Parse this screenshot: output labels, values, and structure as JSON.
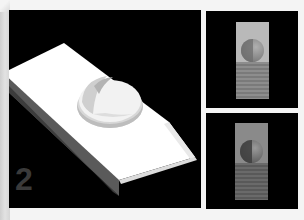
{
  "figure": {
    "step_number": "2",
    "main_view": {
      "description": "3D render of white wedge-shaped block with a dome on top",
      "background": "#000000",
      "object_color": "#ffffff",
      "number_color": "#3a3a3a"
    },
    "thumbnails": [
      {
        "position": "top-right",
        "description": "vertical rectangle with light sphere over striped base",
        "colors": {
          "top": "#b9b9b9",
          "ball": "#8a8a8a",
          "ball_shadow": "#6e6e6e",
          "stripe_a": "#8d8d8d",
          "stripe_b": "#7a7a7a"
        }
      },
      {
        "position": "bottom-right",
        "description": "vertical rectangle with darker sphere over striped base",
        "colors": {
          "top": "#8a8a8a",
          "ball": "#6f6f6f",
          "ball_shadow": "#3e3e3e",
          "stripe_a": "#6a6a6a",
          "stripe_b": "#595959"
        }
      }
    ]
  }
}
